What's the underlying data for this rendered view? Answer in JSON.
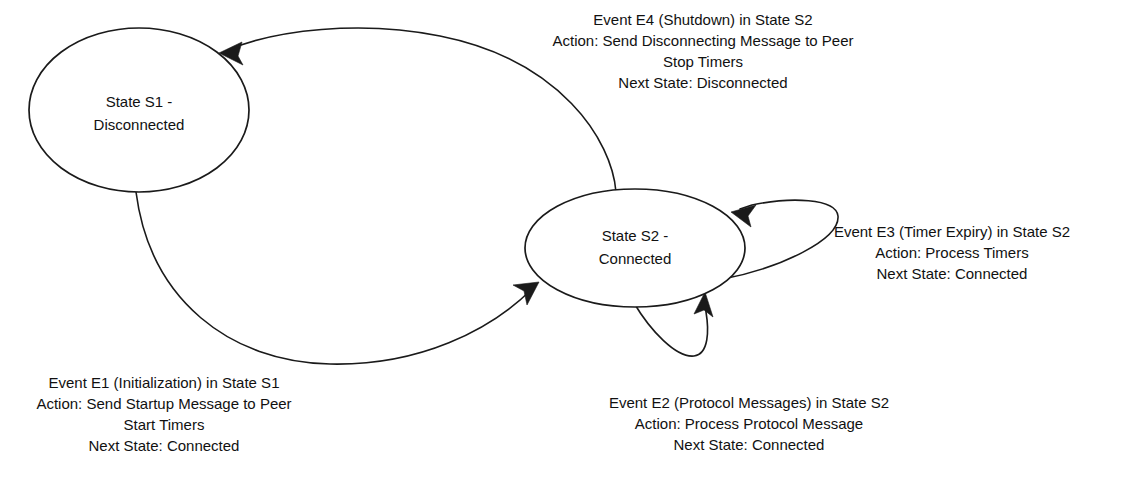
{
  "diagram": {
    "type": "state-machine",
    "background_color": "#ffffff",
    "stroke_color": "#1a1a1a",
    "text_color": "#111111"
  },
  "states": [
    {
      "id": "S1",
      "label_line1": "State S1 -",
      "label_line2": "Disconnected",
      "cx": 139,
      "cy": 110,
      "rx": 110,
      "ry": 82
    },
    {
      "id": "S2",
      "label_line1": "State S2 -",
      "label_line2": "Connected",
      "cx": 635,
      "cy": 248,
      "rx": 110,
      "ry": 59
    }
  ],
  "transitions": [
    {
      "id": "E4",
      "from": "S2",
      "to": "S1",
      "kind": "arc",
      "lines": [
        "Event E4 (Shutdown) in State S2",
        "Action: Send Disconnecting Message to Peer",
        "Stop Timers",
        "Next State: Disconnected"
      ],
      "label_cx": 703,
      "label_top_y": 21
    },
    {
      "id": "E3",
      "from": "S2",
      "to": "S2",
      "kind": "self-loop-right",
      "lines": [
        "Event E3 (Timer Expiry) in State S2",
        "Action: Process Timers",
        "Next State: Connected"
      ],
      "label_cx": 952,
      "label_top_y": 233
    },
    {
      "id": "E1",
      "from": "S1",
      "to": "S2",
      "kind": "arc",
      "lines": [
        "Event E1 (Initialization) in State S1",
        "Action: Send Startup Message to Peer",
        "Start Timers",
        "Next State: Connected"
      ],
      "label_cx": 164,
      "label_top_y": 384
    },
    {
      "id": "E2",
      "from": "S2",
      "to": "S2",
      "kind": "self-loop-bottom",
      "lines": [
        "Event E2 (Protocol Messages) in State S2",
        "Action: Process Protocol Message",
        "Next State: Connected"
      ],
      "label_cx": 749,
      "label_top_y": 404
    }
  ]
}
